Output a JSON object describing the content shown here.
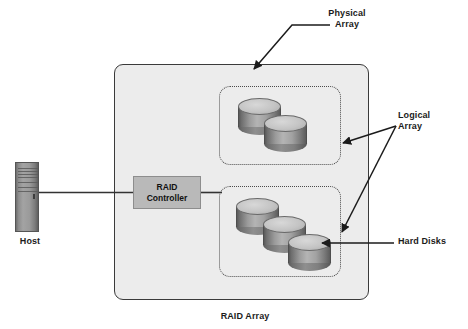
{
  "diagram": {
    "background_color": "#ffffff",
    "enclosure_color": "#ececec",
    "enclosure_border_color": "#3a3a3a",
    "controller_color": "#b9b9b9",
    "line_color": "#222222"
  },
  "labels": {
    "physical_array": "Physical\nArray",
    "logical_array": "Logical\nArray",
    "hard_disks": "Hard Disks",
    "host": "Host",
    "raid_array": "RAID Array",
    "raid_controller": "RAID\nController"
  },
  "nodes": {
    "host": {
      "name": "Host",
      "type": "computer-tower"
    },
    "controller": {
      "name": "RAID Controller",
      "type": "box"
    },
    "physical_array": {
      "name": "Physical Array",
      "type": "enclosure"
    },
    "logical_arrays": [
      {
        "name": "Logical Array 1",
        "disk_count": 2
      },
      {
        "name": "Logical Array 2",
        "disk_count": 3
      }
    ]
  },
  "connections": [
    {
      "from": "Host",
      "to": "RAID Controller",
      "style": "line"
    },
    {
      "from": "RAID Controller",
      "to": "Physical Array",
      "style": "line"
    },
    {
      "from": "Physical Array label",
      "to": "Physical Array enclosure",
      "style": "arrow"
    },
    {
      "from": "Logical Array label",
      "to": "Logical Array 1",
      "style": "arrow"
    },
    {
      "from": "Logical Array label",
      "to": "Logical Array 2",
      "style": "arrow"
    },
    {
      "from": "Hard Disks label",
      "to": "Disk",
      "style": "arrow"
    }
  ]
}
